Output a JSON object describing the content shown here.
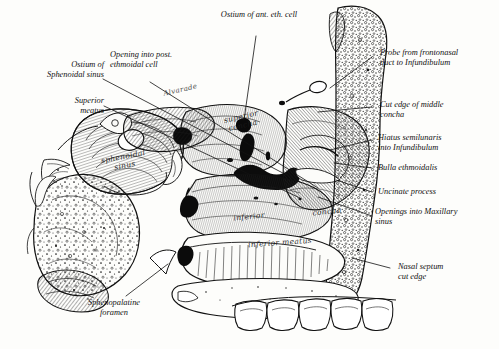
{
  "figure": {
    "background_color": "#fdfdfb",
    "ink_color": "#111111",
    "artist_signature": "Alvarade"
  },
  "callouts": {
    "ostium_ant_eth_cell": "Ostium of ant. eth. cell",
    "probe_frontonasal": "Probe from frontonasal\nduct to Infundibulum",
    "cut_edge_middle_concha": "Cut edge of middle\nconcha",
    "hiatus_semilunaris": "Hiatus semilunaris\ninto Infundibulum",
    "bulla_ethmoidalis": "Bulla ethmoidalis",
    "uncinate_process": "Uncinate process",
    "openings_maxillary": "Openings into Maxillary\nsinus",
    "nasal_septum_cut_edge": "Nasal septum\ncut edge",
    "sphenopalatine_foramen": "Sphenopalatine\nforamen",
    "superior_meatus": "Superior\nmeatus",
    "ostium_sphenoidal_sinus": "Ostium of\nSphenoidal sinus",
    "opening_post_ethmoidal": "Opening into post.\nethmoidal cell"
  },
  "in_figure_labels": {
    "sphenoidal_sinus": "sphenoidal\nsinus",
    "superior_concha": "superior\nconcha",
    "inferior_concha_word1": "inferior",
    "inferior_concha_word2": "concha",
    "inferior_meatus": "inferior meatus"
  }
}
